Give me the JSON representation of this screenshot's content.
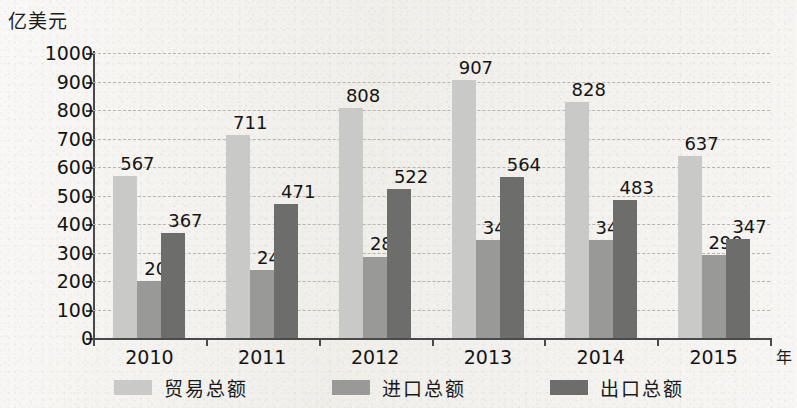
{
  "chart_data": {
    "type": "bar",
    "title": "",
    "xlabel": "年",
    "ylabel": "亿美元",
    "ylim": [
      0,
      1000
    ],
    "ytick_step": 100,
    "grid": true,
    "legend_position": "bottom",
    "categories": [
      "2010",
      "2011",
      "2012",
      "2013",
      "2014",
      "2015"
    ],
    "yticks": [
      "1000",
      "900",
      "800",
      "700",
      "600",
      "500",
      "400",
      "300",
      "200",
      "100",
      "0"
    ],
    "series": [
      {
        "name": "贸易总额",
        "color": "#c9c9c7",
        "values": [
          567,
          711,
          808,
          907,
          828,
          637
        ]
      },
      {
        "name": "进口总额",
        "color": "#999997",
        "values": [
          200,
          240,
          286,
          343,
          345,
          290
        ]
      },
      {
        "name": "出口总额",
        "color": "#6d6d6b",
        "values": [
          367,
          471,
          522,
          564,
          483,
          347
        ]
      }
    ]
  }
}
